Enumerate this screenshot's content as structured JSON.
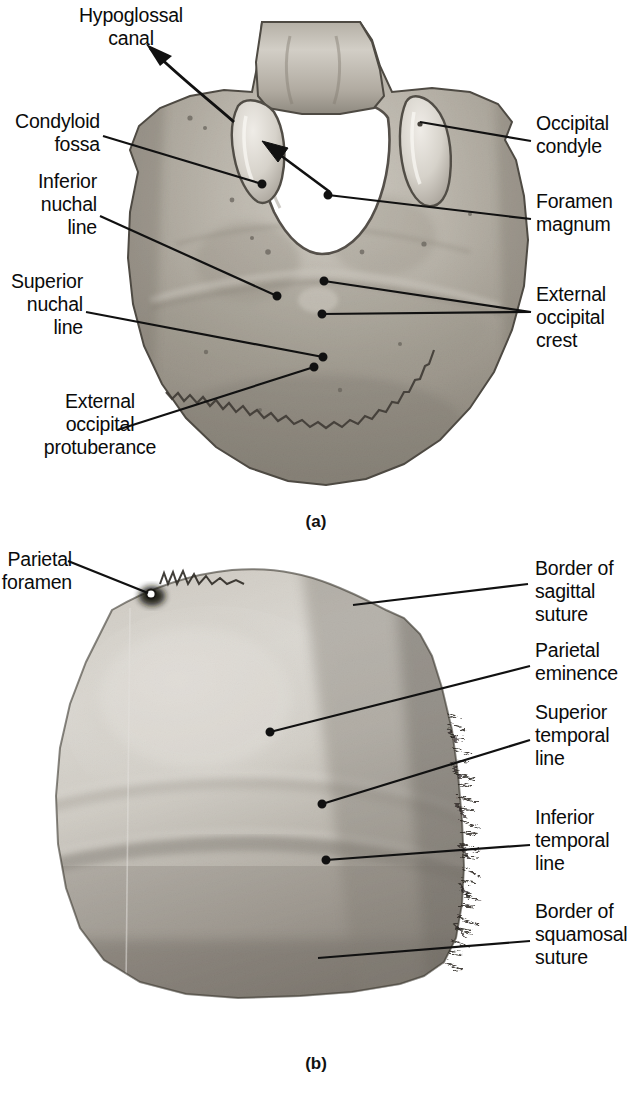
{
  "figure": {
    "panels": [
      {
        "id": "a",
        "caption": "(a)",
        "specimen": "occipital-bone-external-inferior-view",
        "labels": [
          {
            "id": "hypoglossal-canal",
            "text": "Hypoglossal\ncanal",
            "align": "center",
            "side": "left"
          },
          {
            "id": "condyloid-fossa",
            "text": "Condyloid\nfossa",
            "align": "right",
            "side": "left"
          },
          {
            "id": "inferior-nuchal-line",
            "text": "Inferior\nnuchal\nline",
            "align": "right",
            "side": "left"
          },
          {
            "id": "superior-nuchal-line",
            "text": "Superior\nnuchal\nline",
            "align": "right",
            "side": "left"
          },
          {
            "id": "external-occipital-protuberance",
            "text": "External\noccipital\nprotuberance",
            "align": "center",
            "side": "left"
          },
          {
            "id": "occipital-condyle",
            "text": "Occipital\ncondyle",
            "align": "left",
            "side": "right"
          },
          {
            "id": "foramen-magnum",
            "text": "Foramen\nmagnum",
            "align": "left",
            "side": "right"
          },
          {
            "id": "external-occipital-crest",
            "text": "External\noccipital\ncrest",
            "align": "left",
            "side": "right"
          }
        ]
      },
      {
        "id": "b",
        "caption": "(b)",
        "specimen": "parietal-bone-external-lateral-view",
        "labels": [
          {
            "id": "parietal-foramen",
            "text": "Parietal\nforamen",
            "align": "right",
            "side": "left"
          },
          {
            "id": "border-of-sagittal-suture",
            "text": "Border of\nsagittal suture",
            "align": "left",
            "side": "right"
          },
          {
            "id": "parietal-eminence",
            "text": "Parietal\neminence",
            "align": "left",
            "side": "right"
          },
          {
            "id": "superior-temporal-line",
            "text": "Superior\ntemporal\nline",
            "align": "left",
            "side": "right"
          },
          {
            "id": "inferior-temporal-line",
            "text": "Inferior\ntemporal\nline",
            "align": "left",
            "side": "right"
          },
          {
            "id": "border-of-squamosal-suture",
            "text": "Border of\nsquamosal\nsuture",
            "align": "left",
            "side": "right"
          }
        ]
      }
    ],
    "colors": {
      "background": "#ffffff",
      "text": "#0b0b0b",
      "leader_line": "#111111",
      "bone_light": "#e3e0da",
      "bone_mid": "#aaa59c",
      "bone_dark": "#7d776d",
      "bone_shadow": "#5a554d"
    }
  }
}
